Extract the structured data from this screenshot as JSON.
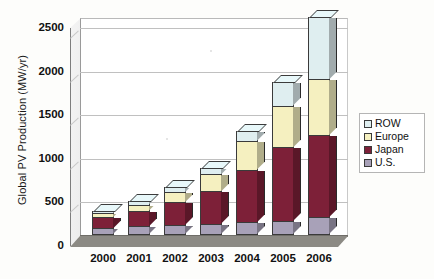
{
  "chart_data": {
    "type": "bar",
    "subtype": "stacked-column-3d",
    "title": "",
    "xlabel": "",
    "ylabel": "Global PV Production (MW/yr)",
    "categories": [
      "2000",
      "2001",
      "2002",
      "2003",
      "2004",
      "2005",
      "2006"
    ],
    "ylim": [
      0,
      2500
    ],
    "yticks": [
      0,
      500,
      1000,
      1500,
      2000,
      2500
    ],
    "ytick_labels": [
      "0",
      "500",
      "1000",
      "1500",
      "2000",
      "2500"
    ],
    "grid": true,
    "legend_position": "right",
    "series": [
      {
        "name": "U.S.",
        "color": "#a8a1b8",
        "values": [
          75,
          100,
          115,
          130,
          145,
          160,
          205
        ]
      },
      {
        "name": "Japan",
        "color": "#7d2038",
        "values": [
          130,
          180,
          260,
          370,
          605,
          845,
          940
        ]
      },
      {
        "name": "Europe",
        "color": "#f5f0c0",
        "values": [
          45,
          70,
          115,
          195,
          330,
          480,
          640
        ]
      },
      {
        "name": "ROW",
        "color": "#dfeef0",
        "values": [
          30,
          45,
          65,
          75,
          110,
          265,
          715
        ]
      }
    ],
    "totals": [
      280,
      395,
      555,
      770,
      1190,
      1750,
      2500
    ],
    "stack_order": [
      "U.S.",
      "Japan",
      "Europe",
      "ROW"
    ]
  },
  "legend": {
    "items": [
      {
        "label": "ROW",
        "color": "#dfeef0"
      },
      {
        "label": "Europe",
        "color": "#f5f0c0"
      },
      {
        "label": "Japan",
        "color": "#7d2038"
      },
      {
        "label": "U.S.",
        "color": "#a8a1b8"
      }
    ]
  },
  "colors": {
    "row": "#dfeef0",
    "europe": "#f5f0c0",
    "japan": "#7d2038",
    "us": "#a8a1b8",
    "floor": "#8c8a84",
    "gridline": "#c0c0c0",
    "axis": "#7d7d7d"
  }
}
